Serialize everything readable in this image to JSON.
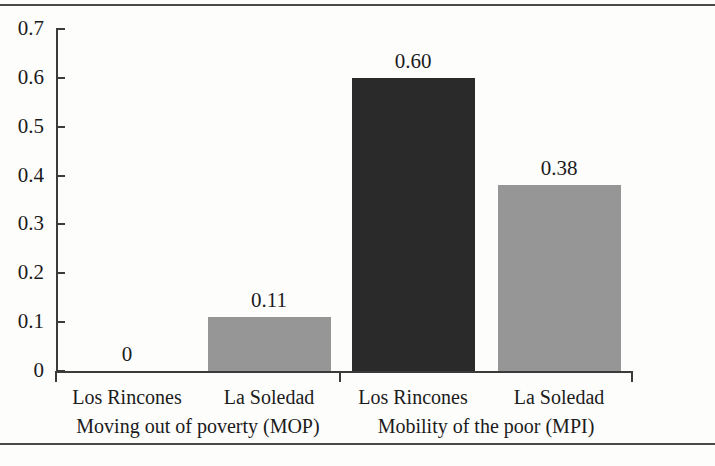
{
  "chart_data": {
    "type": "bar",
    "title": "",
    "xlabel": "",
    "ylabel": "",
    "ylim": [
      0,
      0.7
    ],
    "grid": false,
    "legend": "none",
    "y_ticks": [
      "0",
      "0.1",
      "0.2",
      "0.3",
      "0.4",
      "0.5",
      "0.6",
      "0.7"
    ],
    "y_tick_values": [
      0,
      0.1,
      0.2,
      0.3,
      0.4,
      0.5,
      0.6,
      0.7
    ],
    "groups": [
      {
        "label": "Moving out of poverty (MOP)",
        "bars": [
          {
            "category": "Los Rincones",
            "value": 0,
            "value_label": "0",
            "color": "#969696"
          },
          {
            "category": "La Soledad",
            "value": 0.11,
            "value_label": "0.11",
            "color": "#969696"
          }
        ]
      },
      {
        "label": "Mobility of the poor (MPI)",
        "bars": [
          {
            "category": "Los Rincones",
            "value": 0.6,
            "value_label": "0.60",
            "color": "#2a2a2a"
          },
          {
            "category": "La Soledad",
            "value": 0.38,
            "value_label": "0.38",
            "color": "#969696"
          }
        ]
      }
    ],
    "categories": [
      "Los Rincones",
      "La Soledad"
    ],
    "series": [
      {
        "name": "Moving out of poverty (MOP)",
        "values": [
          0,
          0.11
        ]
      },
      {
        "name": "Mobility of the poor (MPI)",
        "values": [
          0.6,
          0.38
        ]
      }
    ],
    "colors": {
      "dark_bar": "#2a2a2a",
      "gray_bar": "#969696",
      "axis": "#3b3b3b",
      "text": "#1b1b1b"
    }
  }
}
